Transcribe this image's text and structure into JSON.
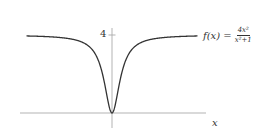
{
  "chart_data": {
    "type": "line",
    "title": "",
    "function": "f(x) = 4x^2/(x^2+1)",
    "legend": {
      "text_lhs": "f(x) =",
      "numerator": "4x²",
      "denominator": "x²+1",
      "position": "right of curve end"
    },
    "xlabel": "x",
    "ylabel": "",
    "xlim": [
      -9.5,
      9.5
    ],
    "ylim": [
      -1.4,
      4.3
    ],
    "yticks": [
      {
        "value": 4,
        "label": "4"
      }
    ],
    "xticks": [],
    "grid": false,
    "series": [
      {
        "name": "f(x)",
        "x": [
          -9,
          -8,
          -7,
          -6,
          -5,
          -4,
          -3,
          -2,
          -1.5,
          -1,
          -0.5,
          0,
          0.5,
          1,
          1.5,
          2,
          3,
          4,
          5,
          6,
          7,
          8,
          9
        ],
        "values": [
          3.95,
          3.94,
          3.92,
          3.89,
          3.85,
          3.76,
          3.6,
          3.2,
          2.77,
          2.0,
          0.8,
          0,
          0.8,
          2.0,
          2.77,
          3.2,
          3.6,
          3.76,
          3.85,
          3.89,
          3.92,
          3.94,
          3.95
        ]
      }
    ],
    "colors": {
      "curve": "#333333",
      "axes": "#aaaaaa",
      "text": "#333333"
    }
  },
  "labels": {
    "ytick_4": "4",
    "x_axis": "x",
    "formula_lhs": "f(x) =",
    "formula_num": "4x²",
    "formula_den": "x²+1"
  }
}
